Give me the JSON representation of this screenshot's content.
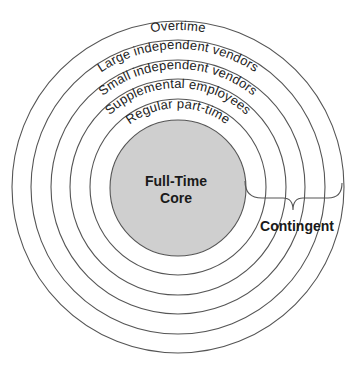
{
  "diagram": {
    "type": "concentric-circles",
    "center": {
      "label_line1": "Full-Time",
      "label_line2": "Core",
      "fill": "#cfcfcf"
    },
    "rings": [
      {
        "label": "Regular part-time"
      },
      {
        "label": "Supplemental employees"
      },
      {
        "label": "Small independent vendors"
      },
      {
        "label": "Large independent vendors"
      },
      {
        "label": "Overtime"
      }
    ],
    "bracket_label": "Contingent",
    "stroke_color": "#555555"
  }
}
